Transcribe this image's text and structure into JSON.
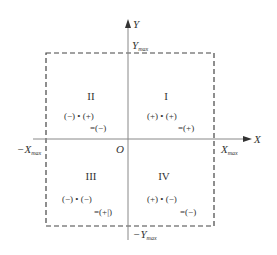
{
  "diagram": {
    "axes": {
      "x_label": "X",
      "y_label": "Y",
      "origin_label": "O",
      "x_max_label": "X",
      "x_max_sub": "max",
      "neg_x_max_label": "−X",
      "neg_x_max_sub": "max",
      "y_max_label": "Y",
      "y_max_sub": "max",
      "neg_y_max_label": "−Y",
      "neg_y_max_sub": "max"
    },
    "quadrants": [
      {
        "numeral": "I",
        "product": "(+) • (+)",
        "result": "=(+)"
      },
      {
        "numeral": "II",
        "product": "(−) • (+)",
        "result": "=(−)"
      },
      {
        "numeral": "III",
        "product": "(−) • (−)",
        "result": "=(+|)"
      },
      {
        "numeral": "IV",
        "product": "(+) • (−)",
        "result": "=(−)"
      }
    ],
    "colors": {
      "axis": "#888888",
      "dashed_box": "#444444",
      "text": "#333333"
    }
  }
}
